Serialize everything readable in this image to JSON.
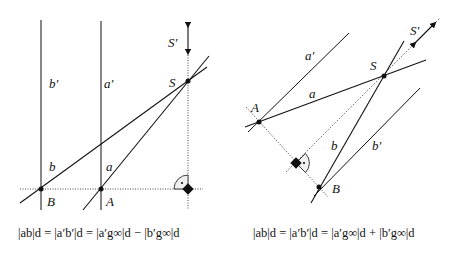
{
  "left_figure": {
    "labels": {
      "b_prime": "b′",
      "a_prime": "a′",
      "b": "b",
      "a": "a",
      "S": "S",
      "S_prime": "S′",
      "A": "A",
      "B": "B"
    },
    "formula": "|ab|_d = |a′b′|_d = |a′g∞|_d − |b′g∞|_d",
    "formula_display": "|ab|d = |a′b′|d = |a′g∞|d − |b′g∞|d"
  },
  "right_figure": {
    "labels": {
      "a_prime": "a′",
      "a": "a",
      "b": "b",
      "b_prime": "b′",
      "S": "S",
      "S_prime": "S′",
      "A": "A",
      "B": "B"
    },
    "formula": "|ab|_d = |a′b′|_d = |a′g∞|_d + |b′g∞|_d",
    "formula_display": "|ab|d = |a′b′|d = |a′g∞|d + |b′g∞|d"
  },
  "colors": {
    "line": "#111111",
    "background": "#ffffff"
  }
}
